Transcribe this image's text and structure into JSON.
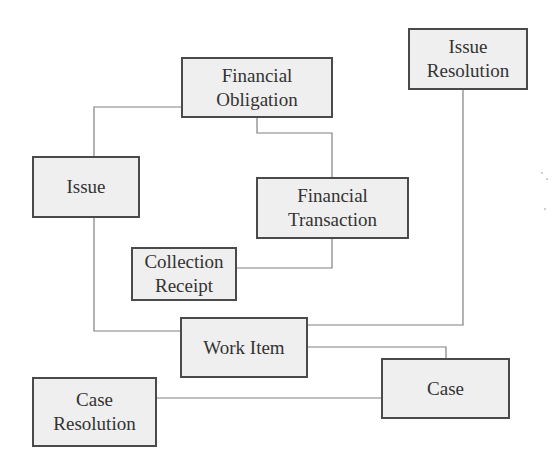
{
  "diagram": {
    "type": "entity-relationship",
    "nodes": [
      {
        "id": "financial_obligation",
        "label": "Financial\nObligation",
        "x": 181,
        "y": 57,
        "w": 152,
        "h": 61
      },
      {
        "id": "issue_resolution",
        "label": "Issue\nResolution",
        "x": 408,
        "y": 28,
        "w": 120,
        "h": 62
      },
      {
        "id": "issue",
        "label": "Issue",
        "x": 32,
        "y": 156,
        "w": 108,
        "h": 62
      },
      {
        "id": "financial_transaction",
        "label": "Financial\nTransaction",
        "x": 256,
        "y": 177,
        "w": 153,
        "h": 62
      },
      {
        "id": "collection_receipt",
        "label": "Collection\nReceipt",
        "x": 131,
        "y": 247,
        "w": 106,
        "h": 54
      },
      {
        "id": "work_item",
        "label": "Work Item",
        "x": 180,
        "y": 317,
        "w": 128,
        "h": 61
      },
      {
        "id": "case",
        "label": "Case",
        "x": 381,
        "y": 358,
        "w": 129,
        "h": 61
      },
      {
        "id": "case_resolution",
        "label": "Case\nResolution",
        "x": 32,
        "y": 377,
        "w": 125,
        "h": 70
      }
    ],
    "edges": [
      {
        "from": "financial_obligation",
        "to": "issue",
        "points": "181,107 94,107 94,156"
      },
      {
        "from": "financial_obligation",
        "to": "financial_transaction",
        "points": "257,118 257,133 332,133 332,177"
      },
      {
        "from": "financial_transaction",
        "to": "collection_receipt",
        "points": "332,239 332,268 237,268"
      },
      {
        "from": "issue",
        "to": "work_item",
        "points": "94,218 94,331 180,331"
      },
      {
        "from": "work_item",
        "to": "issue_resolution",
        "points": "308,325 463,325 463,90"
      },
      {
        "from": "work_item",
        "to": "case",
        "points": "308,347 446,347 446,358"
      },
      {
        "from": "case_resolution",
        "to": "case",
        "points": "157,398 381,398"
      }
    ]
  }
}
